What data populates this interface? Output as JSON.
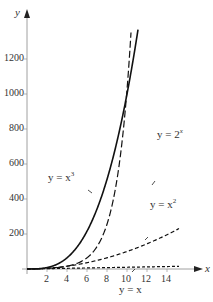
{
  "chart_data": {
    "type": "line",
    "title": "",
    "xlabel": "x",
    "ylabel": "y",
    "xlim": [
      0,
      16
    ],
    "ylim": [
      0,
      1350
    ],
    "xticks": [
      2,
      4,
      6,
      8,
      10,
      12,
      14
    ],
    "yticks": [
      200,
      400,
      600,
      800,
      1000,
      1200
    ],
    "grid": false,
    "legend": "inline curve annotations",
    "series": [
      {
        "name": "y = x^3",
        "style": "solid",
        "x": [
          0,
          1,
          2,
          3,
          4,
          5,
          6,
          7,
          8,
          9,
          10,
          11
        ],
        "values": [
          0,
          1,
          8,
          27,
          64,
          125,
          216,
          343,
          512,
          729,
          1000,
          1331
        ]
      },
      {
        "name": "y = 2^x",
        "style": "long-dash",
        "x": [
          0,
          2,
          4,
          6,
          8,
          9,
          10,
          10.3
        ],
        "values": [
          1,
          4,
          16,
          64,
          256,
          512,
          1024,
          1261
        ]
      },
      {
        "name": "y = x^2",
        "style": "dash",
        "x": [
          0,
          2,
          4,
          6,
          8,
          10,
          12,
          14,
          15
        ],
        "values": [
          0,
          4,
          16,
          36,
          64,
          100,
          144,
          196,
          225
        ]
      },
      {
        "name": "y = x",
        "style": "short-dash",
        "x": [
          0,
          15
        ],
        "values": [
          0,
          15
        ]
      }
    ],
    "annotations": [
      {
        "text": "y = x^3",
        "x": 4.5,
        "y": 630
      },
      {
        "text": "y = 2^x",
        "x": 15,
        "y": 820
      },
      {
        "text": "y = x^2",
        "x": 14.5,
        "y": 390
      },
      {
        "text": "y = x",
        "x": 10,
        "y": -90
      }
    ]
  },
  "labels": {
    "y_axis": "y",
    "x_axis": "x",
    "ann_cube_pre": "y = x",
    "ann_cube_exp": "3",
    "ann_exp_pre": "y = 2",
    "ann_exp_exp": "x",
    "ann_sq_pre": "y = x",
    "ann_sq_exp": "2",
    "ann_lin": "y = x"
  }
}
